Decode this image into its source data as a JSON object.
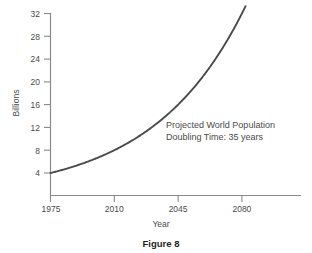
{
  "chart_data": {
    "type": "line",
    "title": "",
    "caption": "Figure 8",
    "xlabel": "Year",
    "ylabel": "Billions",
    "xlim": [
      1975,
      2085
    ],
    "ylim": [
      0,
      32
    ],
    "grid": false,
    "legend": null,
    "x_ticks": [
      1975,
      2010,
      2045,
      2080
    ],
    "x_tick_labels": [
      "1975",
      "2010",
      "2045",
      "2080"
    ],
    "y_ticks": [
      4,
      8,
      12,
      16,
      20,
      24,
      28,
      32
    ],
    "y_tick_labels": [
      "4",
      "8",
      "12",
      "16",
      "20",
      "24",
      "28",
      "32"
    ],
    "annotations": [
      "Projected World Population",
      "Doubling Time:  35 years"
    ],
    "series": [
      {
        "name": "Projected World Population",
        "color": "#4a4a4a",
        "doubling_time_years": 35,
        "x": [
          1975,
          1985,
          1995,
          2005,
          2010,
          2015,
          2025,
          2035,
          2045,
          2055,
          2065,
          2075,
          2080,
          2082
        ],
        "values": [
          4.0,
          4.9,
          5.9,
          7.2,
          8.0,
          8.8,
          10.7,
          13.1,
          16.0,
          19.6,
          23.9,
          29.3,
          32.0,
          33.3
        ]
      }
    ]
  },
  "labels": {
    "y_axis_title": "Billions",
    "x_axis_title": "Year",
    "caption": "Figure 8",
    "annotation_line1": "Projected World Population",
    "annotation_line2": "Doubling Time:  35 years",
    "y_32": "32",
    "y_28": "28",
    "y_24": "24",
    "y_20": "20",
    "y_16": "16",
    "y_12": "12",
    "y_8": "8",
    "y_4": "4",
    "x_1975": "1975",
    "x_2010": "2010",
    "x_2045": "2045",
    "x_2080": "2080"
  },
  "colors": {
    "curve": "#4a4a4a",
    "axis": "#8a8a8a",
    "text": "#4a4a4a",
    "caption": "#1f1f1f",
    "background": "#ffffff"
  }
}
